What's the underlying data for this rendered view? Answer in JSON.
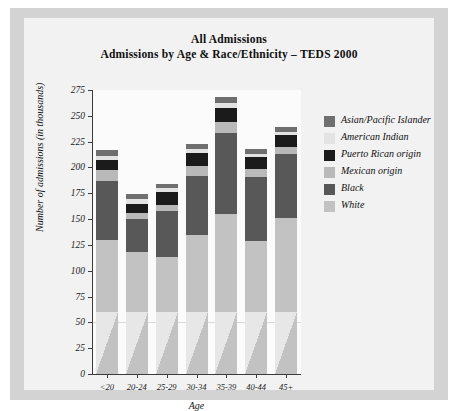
{
  "figure": {
    "title_line1": "All Admissions",
    "title_line2": "Admissions by Age & Race/Ethnicity – TEDS 2000"
  },
  "chart_data": {
    "type": "bar",
    "subtype": "stacked-bar",
    "xlabel": "Age",
    "ylabel": "Number of admissions (in thousands)",
    "categories": [
      "<20",
      "20-24",
      "25-29",
      "30-34",
      "35-39",
      "40-44",
      "45+"
    ],
    "ylim": [
      0,
      275
    ],
    "ytick_step": 25,
    "yticks": [
      0,
      25,
      50,
      75,
      100,
      125,
      150,
      175,
      200,
      225,
      250,
      275
    ],
    "grid": false,
    "legend_position": "right",
    "stack_order_bottom_to_top": [
      "White",
      "Black",
      "Mexican origin",
      "Puerto Rican origin",
      "American Indian",
      "Asian/Pacific Islander"
    ],
    "series": [
      {
        "name": "White",
        "color": "#c2c2c2",
        "values": [
          130,
          118,
          113,
          135,
          155,
          129,
          151
        ]
      },
      {
        "name": "Black",
        "color": "#585858",
        "values": [
          57,
          32,
          45,
          57,
          78,
          62,
          62
        ]
      },
      {
        "name": "Mexican origin",
        "color": "#b9b9b9",
        "values": [
          11,
          6,
          6,
          9,
          11,
          8,
          7
        ]
      },
      {
        "name": "Puerto Rican origin",
        "color": "#1b1b1b",
        "values": [
          9,
          9,
          12,
          13,
          14,
          11,
          11
        ]
      },
      {
        "name": "American Indian",
        "color": "#e3e3e3",
        "values": [
          4,
          4,
          4,
          4,
          4,
          3,
          3
        ]
      },
      {
        "name": "Asian/Pacific Islander",
        "color": "#6f6f6f",
        "values": [
          6,
          5,
          4,
          5,
          6,
          5,
          5
        ]
      }
    ],
    "totals": [
      217,
      174,
      184,
      223,
      268,
      218,
      239
    ],
    "legend": [
      {
        "label": "Asian/Pacific Islander",
        "color": "#6f6f6f"
      },
      {
        "label": "American Indian",
        "color": "#e3e3e3"
      },
      {
        "label": "Puerto Rican origin",
        "color": "#1b1b1b"
      },
      {
        "label": "Mexican origin",
        "color": "#b9b9b9"
      },
      {
        "label": "Black",
        "color": "#585858"
      },
      {
        "label": "White",
        "color": "#c2c2c2"
      }
    ]
  }
}
